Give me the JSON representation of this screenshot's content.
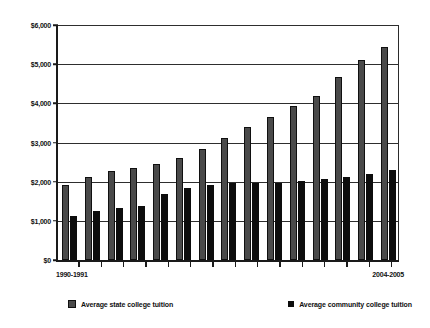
{
  "chart_data": {
    "type": "bar",
    "title": "",
    "xlabel": "",
    "ylabel": "",
    "grid": true,
    "legend_position": "bottom",
    "ylim": [
      0,
      6000
    ],
    "yticks": [
      0,
      1000,
      2000,
      3000,
      4000,
      5000,
      6000
    ],
    "ytick_labels": [
      "$0",
      "$1,000",
      "$2,000",
      "$3,000",
      "$4,000",
      "$5,000",
      "$6,000"
    ],
    "categories": [
      "1990-1991",
      "1991-1992",
      "1992-1993",
      "1993-1994",
      "1994-1995",
      "1995-1996",
      "1996-1997",
      "1997-1998",
      "1998-1999",
      "1999-2000",
      "2000-2001",
      "2001-2002",
      "2002-2003",
      "2003-2004",
      "2004-2005"
    ],
    "xtick_labels_shown": [
      "1990-1991",
      "2004-2005"
    ],
    "series": [
      {
        "name": "Average state college tuition",
        "color": "#4a4a4a",
        "values": [
          1900,
          2090,
          2250,
          2330,
          2430,
          2580,
          2820,
          3090,
          3370,
          3630,
          3890,
          4160,
          4630,
          5060,
          5400
        ]
      },
      {
        "name": "Average community college tuition",
        "color": "#0d0d0d",
        "values": [
          1110,
          1240,
          1320,
          1380,
          1660,
          1830,
          1890,
          1960,
          1940,
          1960,
          2000,
          2060,
          2090,
          2170,
          2280
        ]
      }
    ]
  },
  "axis": {
    "first_label": "1990-1991",
    "last_label": "2004-2005"
  },
  "legend": {
    "items": [
      {
        "label": "Average state college tuition",
        "icon": "square-swatch"
      },
      {
        "label": "Average community college tuition",
        "icon": "square-swatch"
      }
    ]
  }
}
